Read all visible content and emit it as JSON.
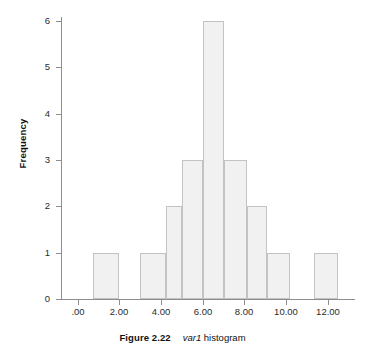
{
  "figure": {
    "caption_label": "Figure 2.22",
    "caption_variable": "var1",
    "caption_rest": "histogram"
  },
  "colors": {
    "bar_fill": "#f1f1f1",
    "bar_border": "#c3c3c3",
    "axis": "#8d8d8d",
    "text": "#1a1a1a",
    "background": "#ffffff"
  },
  "chart_data": {
    "type": "bar",
    "title": "",
    "subtitle": "",
    "xlabel": "",
    "ylabel": "Frequency",
    "grid": false,
    "legend": false,
    "xlim": [
      -0.8,
      13.3
    ],
    "ylim": [
      0,
      6.3
    ],
    "yticks": [
      0,
      1,
      2,
      3,
      4,
      5,
      6
    ],
    "ytick_labels": [
      "0",
      "1",
      "2",
      "3",
      "4",
      "5",
      "6"
    ],
    "xticks": [
      0,
      2,
      4,
      6,
      8,
      10,
      12
    ],
    "xtick_labels": [
      ".00",
      "2.00",
      "4.00",
      "6.00",
      "8.00",
      "10.00",
      "12.00"
    ],
    "bin_width": 1.25,
    "bins": [
      {
        "left": 0.75,
        "right": 2.0,
        "center": 1.375,
        "value": 1
      },
      {
        "left": 3.0,
        "right": 4.25,
        "center": 3.625,
        "value": 1
      },
      {
        "left": 4.25,
        "right": 5.0,
        "center": 4.625,
        "value": 2
      },
      {
        "left": 5.0,
        "right": 6.0,
        "center": 5.5,
        "value": 3
      },
      {
        "left": 6.0,
        "right": 7.0,
        "center": 6.5,
        "value": 6
      },
      {
        "left": 7.0,
        "right": 8.1,
        "center": 7.55,
        "value": 3
      },
      {
        "left": 8.1,
        "right": 9.1,
        "center": 8.6,
        "value": 2
      },
      {
        "left": 9.1,
        "right": 10.2,
        "center": 9.65,
        "value": 1
      },
      {
        "left": 11.35,
        "right": 12.5,
        "center": 11.9,
        "value": 1
      }
    ],
    "categories": [
      "1.375",
      "3.625",
      "4.625",
      "5.5",
      "6.5",
      "7.55",
      "8.6",
      "9.65",
      "11.9"
    ],
    "values": [
      1,
      1,
      2,
      3,
      6,
      3,
      2,
      1,
      1
    ]
  }
}
